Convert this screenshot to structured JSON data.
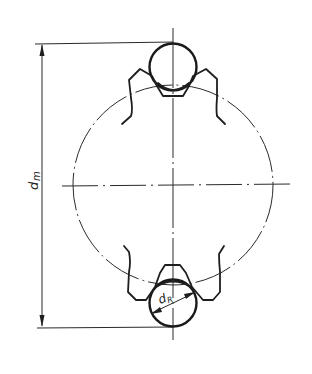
{
  "diagram": {
    "title": "",
    "labels": {
      "mean_diameter": "d",
      "mean_diameter_sub": "m",
      "ball_diameter": "d",
      "ball_diameter_sub": "R"
    },
    "elements": [
      "pitch-circle",
      "top-ball",
      "bottom-ball",
      "top-cage-pocket",
      "bottom-cage-pocket",
      "vertical-centerline",
      "horizontal-centerline",
      "dimension-line-dm",
      "dimension-line-dR"
    ],
    "colors": {
      "line": "#1e1e1e",
      "background": "#ffffff"
    }
  }
}
